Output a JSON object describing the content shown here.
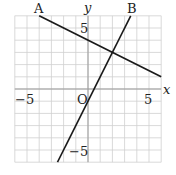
{
  "chart_data": {
    "type": "line",
    "title": "",
    "xlabel": "x",
    "ylabel": "y",
    "xlim": [
      -6,
      6
    ],
    "ylim": [
      -6,
      6
    ],
    "grid": true,
    "grid_step": 1,
    "x_ticks_labeled": [
      -5,
      5
    ],
    "y_ticks_labeled": [
      5,
      -5
    ],
    "origin_label": "O",
    "series": [
      {
        "name": "A",
        "equation": "y = -0.5x + 4",
        "x": [
          -4,
          6
        ],
        "y": [
          6,
          1
        ]
      },
      {
        "name": "B",
        "equation": "y = 2x - 1",
        "x": [
          -2.5,
          3.5
        ],
        "y": [
          -6,
          6
        ]
      }
    ],
    "intersection": {
      "x": 2,
      "y": 3
    }
  },
  "labels": {
    "x_axis": "x",
    "y_axis": "y",
    "origin": "O",
    "x_neg5": "−5",
    "x_pos5": "5",
    "y_pos5": "5",
    "y_neg5": "−5",
    "line_a": "A",
    "line_b": "B"
  },
  "colors": {
    "grid": "#cfcfcf",
    "axis": "#9a9a9a",
    "line": "#1a1a1a"
  }
}
